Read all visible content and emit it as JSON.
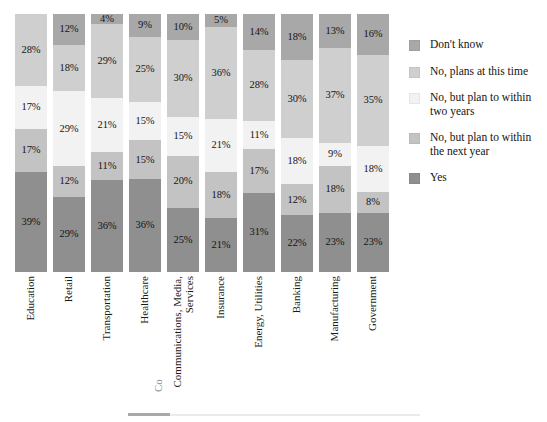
{
  "chart_data": {
    "type": "bar",
    "subtype": "stacked-bar-100",
    "title": "",
    "xlabel": "",
    "ylabel": "",
    "ylim": [
      0,
      100
    ],
    "grid": false,
    "legend_position": "right",
    "orientation": "vertical",
    "value_suffix": "%",
    "categories": [
      "Education",
      "Retail",
      "Transportation",
      "Healthcare",
      "Communications, Media, Services",
      "Insurance",
      "Energy, Utilities",
      "Banking",
      "Manufacturing",
      "Government"
    ],
    "series": [
      {
        "name": "Yes",
        "color": "#8f8f8f",
        "values": [
          39,
          29,
          36,
          36,
          25,
          21,
          31,
          22,
          23,
          23
        ],
        "labels": [
          "39%",
          "29%",
          "36%",
          "36%",
          "25%",
          "21%",
          "31%",
          "22%",
          "23%",
          "23%"
        ]
      },
      {
        "name": "No, but plan to within the next year",
        "color": "#c3c3c3",
        "values": [
          17,
          12,
          11,
          15,
          20,
          18,
          17,
          12,
          18,
          8
        ],
        "labels": [
          "17%",
          "12%",
          "11%",
          "15%",
          "20%",
          "18%",
          "17%",
          "12%",
          "18%",
          "8%"
        ]
      },
      {
        "name": "No, but plan to within two years",
        "color": "#f2f2f2",
        "values": [
          17,
          29,
          21,
          15,
          15,
          21,
          11,
          18,
          9,
          18
        ],
        "labels": [
          "17%",
          "29%",
          "21%",
          "15%",
          "15%",
          "21%",
          "11%",
          "18%",
          "9%",
          "18%"
        ]
      },
      {
        "name": "No, plans at this time",
        "color": "#cfcfcf",
        "values": [
          28,
          18,
          29,
          25,
          30,
          36,
          28,
          30,
          37,
          35
        ],
        "labels": [
          "28%",
          "18%",
          "29%",
          "25%",
          "30%",
          "36%",
          "28%",
          "30%",
          "37%",
          "35%"
        ]
      },
      {
        "name": "Don't know",
        "color": "#a8a8a8",
        "values": [
          0,
          12,
          4,
          9,
          10,
          5,
          14,
          18,
          13,
          16
        ],
        "labels": [
          "",
          "12%",
          "4%",
          "9%",
          "10%",
          "5%",
          "14%",
          "18%",
          "13%",
          "16%"
        ]
      }
    ]
  },
  "legend": {
    "items": [
      {
        "label": "Don't know",
        "color": "#a8a8a8"
      },
      {
        "label": "No, plans at this time",
        "color": "#cfcfcf"
      },
      {
        "label": "No, but plan to within two years",
        "color": "#f2f2f2"
      },
      {
        "label": "No, but plan to within the next year",
        "color": "#c3c3c3"
      },
      {
        "label": "Yes",
        "color": "#8f8f8f"
      }
    ]
  }
}
